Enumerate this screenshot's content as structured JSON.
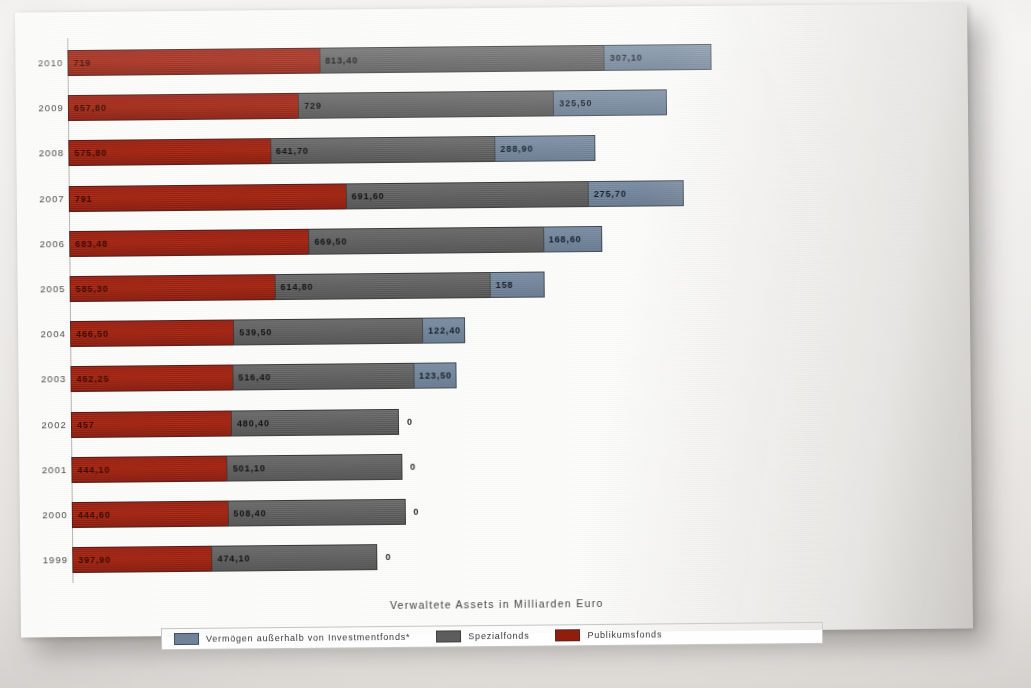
{
  "chart_data": {
    "type": "bar",
    "orientation": "horizontal",
    "stacked": true,
    "title": "",
    "xlabel": "Verwaltete Assets in Milliarden Euro",
    "ylabel": "",
    "categories": [
      "2010",
      "2009",
      "2008",
      "2007",
      "2006",
      "2005",
      "2004",
      "2003",
      "2002",
      "2001",
      "2000",
      "1999"
    ],
    "series": [
      {
        "name": "Publikumsfonds",
        "color": "#9e2113",
        "values": [
          719,
          657.8,
          575.8,
          791,
          683.48,
          585.3,
          466.5,
          462.25,
          457,
          444.1,
          444.6,
          397.9
        ],
        "labels": [
          "719",
          "657,80",
          "575,80",
          "791",
          "683,48",
          "585,30",
          "466,50",
          "462,25",
          "457",
          "444,10",
          "444,60",
          "397,90"
        ]
      },
      {
        "name": "Spezialfonds",
        "color": "#626262",
        "values": [
          813.4,
          729,
          641.7,
          691.6,
          669.5,
          614.8,
          539.5,
          516.4,
          480.4,
          501.1,
          508.4,
          474.1
        ],
        "labels": [
          "813,40",
          "729",
          "641,70",
          "691,60",
          "669,50",
          "614,80",
          "539,50",
          "516,40",
          "480,40",
          "501,10",
          "508,40",
          "474,10"
        ]
      },
      {
        "name": "Vermögen außerhalb von Investmentfonds*",
        "color": "#74879d",
        "values": [
          307.1,
          325.5,
          288.9,
          275.7,
          168.6,
          158,
          122.4,
          123.5,
          0,
          0,
          0,
          0
        ],
        "labels": [
          "307,10",
          "325,50",
          "288,90",
          "275,70",
          "168,60",
          "158",
          "122,40",
          "123,50",
          "0",
          "0",
          "0",
          "0"
        ]
      }
    ],
    "xlim": [
      0,
      2000
    ],
    "grid": false,
    "legend_position": "bottom"
  },
  "legend": {
    "items": [
      {
        "label": "Vermögen außerhalb von Investmentfonds*",
        "swatch": "blue"
      },
      {
        "label": "Spezialfonds",
        "swatch": "grey"
      },
      {
        "label": "Publikumsfonds",
        "swatch": "red"
      }
    ]
  },
  "axis": {
    "x_title": "Verwaltete Assets in Milliarden Euro"
  }
}
